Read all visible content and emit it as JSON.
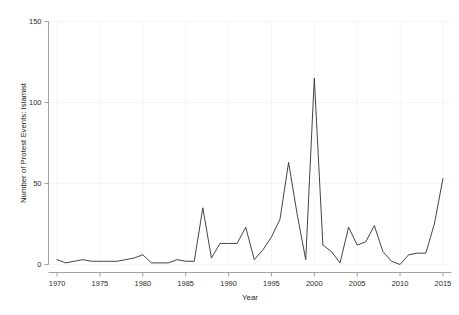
{
  "chart_data": {
    "type": "line",
    "title": "",
    "xlabel": "Year",
    "ylabel": "Number of Protest Events: Islamist",
    "xlim": [
      1969,
      2016
    ],
    "ylim": [
      0,
      150
    ],
    "xticks": [
      1970,
      1975,
      1980,
      1985,
      1990,
      1995,
      2000,
      2005,
      2010,
      2015
    ],
    "yticks": [
      0,
      50,
      100,
      150
    ],
    "grid": true,
    "legend": null,
    "series": [
      {
        "name": "Protest Events: Islamist",
        "x": [
          1970,
          1971,
          1972,
          1973,
          1974,
          1975,
          1976,
          1977,
          1978,
          1979,
          1980,
          1981,
          1982,
          1983,
          1984,
          1985,
          1986,
          1987,
          1988,
          1989,
          1990,
          1991,
          1992,
          1993,
          1994,
          1995,
          1996,
          1997,
          1998,
          1999,
          2000,
          2001,
          2002,
          2003,
          2004,
          2005,
          2006,
          2007,
          2008,
          2009,
          2010,
          2011,
          2012,
          2013,
          2014,
          2015
        ],
        "values": [
          3,
          1,
          2,
          3,
          2,
          2,
          2,
          2,
          3,
          4,
          6,
          1,
          1,
          1,
          3,
          2,
          2,
          35,
          4,
          13,
          13,
          13,
          23,
          3,
          9,
          17,
          28,
          63,
          31,
          3,
          115,
          12,
          8,
          1,
          23,
          12,
          14,
          24,
          8,
          2,
          0,
          6,
          7,
          7,
          25,
          53
        ]
      }
    ]
  },
  "axes": {
    "ytick_labels": [
      "0",
      "50",
      "100",
      "150"
    ],
    "xtick_labels": [
      "1970",
      "1975",
      "1980",
      "1985",
      "1990",
      "1995",
      "2000",
      "2005",
      "2010",
      "2015"
    ],
    "xlabel_text": "Year",
    "ylabel_text": "Number of Protest Events: Islamist"
  },
  "colors": {
    "line": "#3a3a3a",
    "axis": "#8c8c8c",
    "grid": "#f4f4f4",
    "text": "#2b2b2b",
    "background": "#ffffff"
  }
}
